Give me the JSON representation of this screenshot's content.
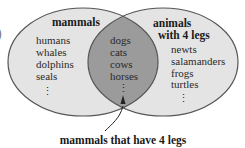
{
  "diagram": {
    "type": "venn",
    "colors": {
      "set_fill": "#e4e4e4",
      "intersection_fill": "#9b9b9b",
      "outline": "#555555",
      "text": "#2a2a2a",
      "arrow": "#222222"
    },
    "edge_mark": ")",
    "sets": [
      {
        "id": "mammals",
        "title_lines": [
          "mammals"
        ],
        "items": [
          "humans",
          "whales",
          "dolphins",
          "seals"
        ],
        "continuation": "⋮"
      },
      {
        "id": "four_legs",
        "title_lines": [
          "animals",
          "with 4 legs"
        ],
        "items": [
          "newts",
          "salamanders",
          "frogs",
          "turtles"
        ],
        "continuation": "⋮"
      }
    ],
    "intersection": {
      "items": [
        "dogs",
        "cats",
        "cows",
        "horses"
      ],
      "continuation": "⋮",
      "callout": "mammals that have 4 legs"
    }
  }
}
